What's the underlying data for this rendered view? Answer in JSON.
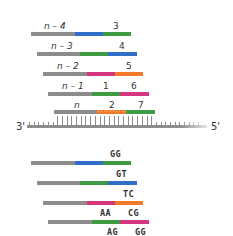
{
  "colors": {
    "gray": "#8c8c8c",
    "blue": "#2f6fc9",
    "green": "#3f9a44",
    "pink": "#d6377c",
    "orange": "#f27a2b"
  },
  "template": {
    "left_label": "3'",
    "right_label": "5'"
  },
  "upper_panel": {
    "rows": [
      {
        "primer_label": "n – 4",
        "labels": [
          "3"
        ],
        "segments": [
          "gray",
          "blue",
          "green"
        ]
      },
      {
        "primer_label": "n – 3",
        "labels": [
          "4"
        ],
        "segments": [
          "gray",
          "green",
          "blue"
        ]
      },
      {
        "primer_label": "n – 2",
        "labels": [
          "5"
        ],
        "segments": [
          "gray",
          "pink",
          "orange"
        ]
      },
      {
        "primer_label": "n – 1",
        "labels": [
          "1",
          "6"
        ],
        "segments": [
          "gray",
          "green",
          "pink"
        ]
      },
      {
        "primer_label": "n",
        "labels": [
          "2",
          "7"
        ],
        "segments": [
          "gray",
          "orange",
          "green"
        ]
      }
    ]
  },
  "lower_panel": {
    "rows": [
      {
        "labels": [
          "GG"
        ],
        "segments": [
          "gray",
          "blue",
          "green"
        ]
      },
      {
        "labels": [
          "GT"
        ],
        "segments": [
          "gray",
          "green",
          "blue"
        ]
      },
      {
        "labels": [
          "TC"
        ],
        "segments": [
          "gray",
          "pink",
          "orange"
        ]
      },
      {
        "labels": [
          "AA",
          "CG"
        ],
        "segments": [
          "gray",
          "green",
          "pink"
        ]
      },
      {
        "labels": [
          "AG",
          "GG"
        ],
        "segments": []
      }
    ]
  }
}
